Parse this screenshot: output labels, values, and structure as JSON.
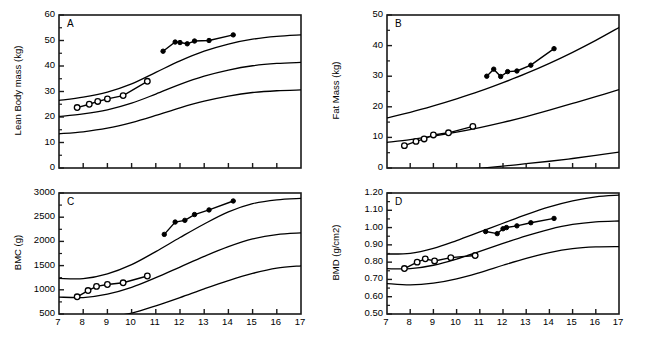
{
  "figure": {
    "background": "#ffffff",
    "line_color": "#000000",
    "panel_count": 4
  },
  "chart_data": [
    {
      "type": "line",
      "panel": "A",
      "title": "",
      "xlabel": "",
      "ylabel": "Lean Body mass (kg)",
      "xlim": [
        7,
        17
      ],
      "ylim": [
        0,
        60
      ],
      "xticks": [
        7,
        8,
        9,
        10,
        11,
        12,
        13,
        14,
        15,
        16,
        17
      ],
      "yticks": [
        0,
        10,
        20,
        30,
        40,
        50,
        60
      ],
      "ytick_labels": [
        "0",
        "10",
        "20",
        "30",
        "40",
        "50",
        "60"
      ],
      "xtick_labels": [
        "",
        "",
        "",
        "",
        "",
        "",
        "",
        "",
        "",
        "",
        ""
      ],
      "grid": false,
      "legend": "none",
      "series": [
        {
          "name": "open-circle-subject",
          "marker": "open-circle",
          "x": [
            7.75,
            8.25,
            8.6,
            9.0,
            9.65,
            10.65
          ],
          "y": [
            23.7,
            25.0,
            26.1,
            27.1,
            28.4,
            34.0
          ]
        },
        {
          "name": "filled-circle-subject",
          "marker": "filled-circle",
          "x": [
            11.3,
            11.8,
            12.0,
            12.3,
            12.6,
            13.2,
            14.2
          ],
          "y": [
            45.8,
            49.4,
            49.2,
            48.7,
            49.8,
            50.0,
            52.2
          ]
        }
      ],
      "reference_curves": [
        {
          "name": "upper-percentile",
          "x": [
            7,
            8,
            9,
            10,
            11,
            12,
            13,
            14,
            15,
            16,
            17
          ],
          "y": [
            26.5,
            27.8,
            29.8,
            33.0,
            37.5,
            42.0,
            45.8,
            48.6,
            50.5,
            51.6,
            52.2
          ]
        },
        {
          "name": "median-percentile",
          "x": [
            7,
            8,
            9,
            10,
            11,
            12,
            13,
            14,
            15,
            16,
            17
          ],
          "y": [
            20.2,
            21.2,
            22.8,
            25.4,
            29.0,
            32.8,
            36.0,
            38.4,
            40.1,
            41.0,
            41.4
          ]
        },
        {
          "name": "lower-percentile",
          "x": [
            7,
            8,
            9,
            10,
            11,
            12,
            13,
            14,
            15,
            16,
            17
          ],
          "y": [
            13.4,
            14.2,
            15.6,
            17.8,
            20.6,
            23.6,
            26.2,
            28.2,
            29.6,
            30.3,
            30.6
          ]
        }
      ]
    },
    {
      "type": "line",
      "panel": "B",
      "title": "",
      "xlabel": "",
      "ylabel": "Fat Mass (kg)",
      "xlim": [
        7,
        17
      ],
      "ylim": [
        0,
        50
      ],
      "xticks": [
        7,
        8,
        9,
        10,
        11,
        12,
        13,
        14,
        15,
        16,
        17
      ],
      "yticks": [
        0,
        10,
        20,
        30,
        40,
        50
      ],
      "ytick_labels": [
        "0",
        "10",
        "20",
        "30",
        "40",
        "50"
      ],
      "xtick_labels": [
        "",
        "",
        "",
        "",
        "",
        "",
        "",
        "",
        "",
        "",
        ""
      ],
      "grid": false,
      "legend": "none",
      "series": [
        {
          "name": "open-circle-subject",
          "marker": "open-circle",
          "x": [
            7.75,
            8.25,
            8.6,
            9.0,
            9.65,
            10.7
          ],
          "y": [
            7.3,
            8.7,
            9.5,
            10.8,
            11.5,
            13.6
          ]
        },
        {
          "name": "filled-circle-subject",
          "marker": "filled-circle",
          "x": [
            11.3,
            11.6,
            11.9,
            12.2,
            12.6,
            13.2,
            14.2
          ],
          "y": [
            30.0,
            32.3,
            29.9,
            31.5,
            31.7,
            33.6,
            39.0
          ]
        }
      ],
      "reference_curves": [
        {
          "name": "upper-percentile",
          "x": [
            7,
            8,
            9,
            10,
            11,
            12,
            13,
            14,
            15,
            16,
            17
          ],
          "y": [
            16.4,
            18.2,
            20.3,
            22.6,
            25.1,
            27.9,
            30.9,
            34.2,
            37.8,
            41.7,
            45.9
          ]
        },
        {
          "name": "median-percentile",
          "x": [
            7,
            8,
            9,
            10,
            11,
            12,
            13,
            14,
            15,
            16,
            17
          ],
          "y": [
            8.4,
            9.3,
            10.4,
            11.7,
            13.2,
            14.9,
            16.8,
            18.9,
            21.1,
            23.3,
            25.6
          ]
        },
        {
          "name": "lower-percentile",
          "x": [
            7,
            8,
            9,
            10,
            11,
            12,
            13,
            14,
            15,
            16,
            17
          ],
          "y": [
            -2.0,
            -1.6,
            -1.2,
            -0.7,
            -0.1,
            0.6,
            1.4,
            2.2,
            3.1,
            4.1,
            5.2
          ]
        }
      ]
    },
    {
      "type": "line",
      "panel": "C",
      "title": "",
      "xlabel": "",
      "ylabel": "BMC (g)",
      "xlim": [
        7,
        17
      ],
      "ylim": [
        500,
        3000
      ],
      "xticks": [
        7,
        8,
        9,
        10,
        11,
        12,
        13,
        14,
        15,
        16,
        17
      ],
      "yticks": [
        500,
        1000,
        1500,
        2000,
        2500,
        3000
      ],
      "ytick_labels": [
        "500",
        "1000",
        "1500",
        "2000",
        "2500",
        "3000"
      ],
      "xtick_labels": [
        "7",
        "8",
        "9",
        "10",
        "11",
        "12",
        "13",
        "14",
        "15",
        "16",
        "17"
      ],
      "grid": false,
      "legend": "none",
      "series": [
        {
          "name": "open-circle-subject",
          "marker": "open-circle",
          "x": [
            7.75,
            8.2,
            8.55,
            9.0,
            9.65,
            10.65
          ],
          "y": [
            855,
            985,
            1070,
            1110,
            1145,
            1285
          ]
        },
        {
          "name": "filled-circle-subject",
          "marker": "filled-circle",
          "x": [
            11.35,
            11.8,
            12.2,
            12.6,
            13.2,
            14.2
          ],
          "y": [
            2145,
            2400,
            2435,
            2555,
            2650,
            2835
          ]
        }
      ],
      "reference_curves": [
        {
          "name": "upper-percentile",
          "x": [
            7,
            8,
            9,
            10,
            11,
            12,
            13,
            14,
            15,
            16,
            17
          ],
          "y": [
            1235,
            1230,
            1330,
            1520,
            1790,
            2080,
            2360,
            2610,
            2780,
            2860,
            2890
          ]
        },
        {
          "name": "median-percentile",
          "x": [
            7,
            8,
            9,
            10,
            11,
            12,
            13,
            14,
            15,
            16,
            17
          ],
          "y": [
            850,
            840,
            910,
            1050,
            1250,
            1470,
            1690,
            1890,
            2050,
            2140,
            2175
          ]
        },
        {
          "name": "lower-percentile",
          "x": [
            7,
            8,
            9,
            10,
            11,
            12,
            13,
            14,
            15,
            16,
            17
          ],
          "y": [
            330,
            370,
            430,
            520,
            670,
            840,
            1020,
            1190,
            1340,
            1450,
            1495
          ]
        }
      ]
    },
    {
      "type": "line",
      "panel": "D",
      "title": "",
      "xlabel": "",
      "ylabel": "BMD (g/cm2)",
      "xlim": [
        7,
        17
      ],
      "ylim": [
        0.5,
        1.2
      ],
      "xticks": [
        7,
        8,
        9,
        10,
        11,
        12,
        13,
        14,
        15,
        16,
        17
      ],
      "yticks": [
        0.5,
        0.6,
        0.7,
        0.8,
        0.9,
        1.0,
        1.1,
        1.2
      ],
      "ytick_labels": [
        "0.50",
        "0.60",
        "0.70",
        "0.80",
        "0.90",
        "1.00",
        "1.10",
        "1.20"
      ],
      "xtick_labels": [
        "7",
        "8",
        "9",
        "10",
        "11",
        "12",
        "13",
        "14",
        "15",
        "16",
        "17"
      ],
      "grid": false,
      "legend": "none",
      "series": [
        {
          "name": "open-circle-subject",
          "marker": "open-circle",
          "x": [
            7.75,
            8.3,
            8.65,
            9.05,
            9.75,
            10.8
          ],
          "y": [
            0.763,
            0.8,
            0.819,
            0.807,
            0.826,
            0.838
          ]
        },
        {
          "name": "filled-circle-subject",
          "marker": "filled-circle",
          "x": [
            11.25,
            11.75,
            12.0,
            12.15,
            12.6,
            13.2,
            14.2
          ],
          "y": [
            0.977,
            0.965,
            0.993,
            1.0,
            1.01,
            1.028,
            1.053
          ]
        }
      ],
      "reference_curves": [
        {
          "name": "upper-percentile",
          "x": [
            7,
            8,
            9,
            10,
            11,
            12,
            13,
            14,
            15,
            16,
            17
          ],
          "y": [
            0.847,
            0.851,
            0.88,
            0.925,
            0.975,
            1.025,
            1.075,
            1.12,
            1.155,
            1.178,
            1.188
          ]
        },
        {
          "name": "median-percentile",
          "x": [
            7,
            8,
            9,
            10,
            11,
            12,
            13,
            14,
            15,
            16,
            17
          ],
          "y": [
            0.762,
            0.762,
            0.782,
            0.818,
            0.862,
            0.908,
            0.952,
            0.99,
            1.018,
            1.033,
            1.038
          ]
        },
        {
          "name": "lower-percentile",
          "x": [
            7,
            8,
            9,
            10,
            11,
            12,
            13,
            14,
            15,
            16,
            17
          ],
          "y": [
            0.676,
            0.668,
            0.678,
            0.703,
            0.74,
            0.782,
            0.822,
            0.855,
            0.878,
            0.888,
            0.89
          ]
        }
      ]
    }
  ]
}
